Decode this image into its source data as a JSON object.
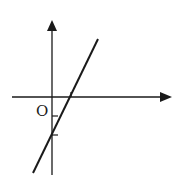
{
  "diagram": {
    "type": "linear-function-graph",
    "origin_label": "O",
    "colors": {
      "ink": "#1a1a1a",
      "background": "#ffffff"
    },
    "x_axis": {
      "y": 97,
      "x_start": 12,
      "x_end": 172
    },
    "y_axis": {
      "x": 52,
      "y_start": 175,
      "y_end": 20
    },
    "line": {
      "x1": 33,
      "y1": 173,
      "x2": 98,
      "y2": 39
    },
    "y_ticks": [
      116,
      135
    ],
    "x_ticks": [
      70
    ]
  }
}
